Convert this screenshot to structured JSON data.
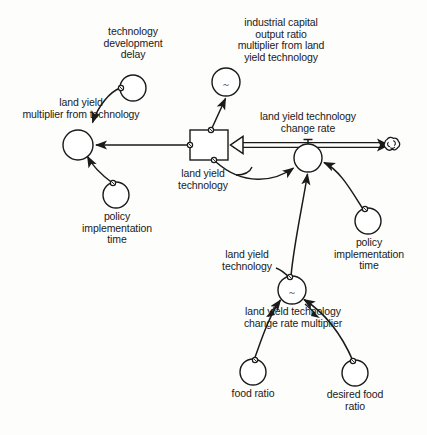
{
  "diagram": {
    "type": "system-dynamics-stock-flow",
    "title_visible": false,
    "background_color": "#fdfdfc",
    "stroke_color": "#1a1a1a",
    "labels": {
      "technology_development_delay": "technology\ndevelopment\ndelay",
      "industrial_capital_multiplier": "industrial capital\noutput ratio\nmultiplier from land\nyield technology",
      "land_yield_multiplier_from_technology": "land yield\nmultiplier from technology",
      "land_yield_technology_change_rate": "land yield technology\nchange rate",
      "land_yield_technology_stock": "land yield\ntechnology",
      "policy_implementation_time_left": "policy\nimplementation\ntime",
      "policy_implementation_time_right": "policy\nimplementation\ntime",
      "land_yield_technology_aux": "land yield\ntechnology",
      "land_yield_technology_change_rate_multiplier": "land yield technology\nchange rate multiplier",
      "food_ratio": "food ratio",
      "desired_food_ratio": "desired food\nratio"
    },
    "nodes": [
      {
        "id": "technology-development-delay",
        "kind": "auxiliary-circle",
        "label": "technology development delay",
        "cx": 133,
        "cy": 88,
        "r": 13,
        "marker": ""
      },
      {
        "id": "industrial-capital-output-ratio-multiplier",
        "kind": "auxiliary-circle",
        "label": "industrial capital output ratio multiplier from land yield technology",
        "cx": 226,
        "cy": 82,
        "r": 14,
        "marker": "~"
      },
      {
        "id": "land-yield-multiplier-from-technology",
        "kind": "auxiliary-circle",
        "label": "land yield multiplier from technology",
        "cx": 78,
        "cy": 145,
        "r": 15,
        "marker": ""
      },
      {
        "id": "land-yield-technology-stock",
        "kind": "stock-box",
        "label": "land yield technology",
        "x": 190,
        "y": 130,
        "w": 38,
        "h": 30
      },
      {
        "id": "land-yield-technology-change-rate-valve",
        "kind": "flow-valve-circle",
        "label": "land yield technology change rate",
        "cx": 308,
        "cy": 158,
        "r": 14,
        "marker": ""
      },
      {
        "id": "sink-cloud",
        "kind": "cloud",
        "label": "",
        "cx": 392,
        "cy": 146,
        "r": 10
      },
      {
        "id": "policy-implementation-time-left",
        "kind": "auxiliary-circle",
        "label": "policy implementation time",
        "cx": 116,
        "cy": 195,
        "r": 13,
        "marker": ""
      },
      {
        "id": "policy-implementation-time-right",
        "kind": "auxiliary-circle",
        "label": "policy implementation time",
        "cx": 368,
        "cy": 221,
        "r": 13,
        "marker": ""
      },
      {
        "id": "land-yield-technology-change-rate-multiplier",
        "kind": "auxiliary-circle",
        "label": "land yield technology change rate multiplier",
        "cx": 292,
        "cy": 290,
        "r": 14,
        "marker": "~"
      },
      {
        "id": "food-ratio",
        "kind": "auxiliary-circle",
        "label": "food ratio",
        "cx": 253,
        "cy": 372,
        "r": 13,
        "marker": ""
      },
      {
        "id": "desired-food-ratio",
        "kind": "auxiliary-circle",
        "label": "desired food ratio",
        "cx": 355,
        "cy": 373,
        "r": 13,
        "marker": ""
      }
    ],
    "connectors": [
      {
        "from": "technology-development-delay",
        "to": "land-yield-multiplier-from-technology",
        "style": "curved-arrow"
      },
      {
        "from": "land-yield-technology-stock",
        "to": "industrial-capital-output-ratio-multiplier",
        "style": "straight-arrow"
      },
      {
        "from": "land-yield-technology-stock",
        "to": "land-yield-multiplier-from-technology",
        "style": "straight-arrow"
      },
      {
        "from": "policy-implementation-time-left",
        "to": "land-yield-multiplier-from-technology",
        "style": "curved-arrow"
      },
      {
        "from": "land-yield-technology-stock",
        "to": "land-yield-technology-change-rate-valve",
        "style": "curved-arrow"
      },
      {
        "from": "policy-implementation-time-right",
        "to": "land-yield-technology-change-rate-valve",
        "style": "curved-arrow"
      },
      {
        "from": "land-yield-technology-change-rate-multiplier",
        "to": "land-yield-technology-change-rate-valve",
        "style": "curved-arrow"
      },
      {
        "from": "food-ratio",
        "to": "land-yield-technology-change-rate-multiplier",
        "style": "curved-arrow"
      },
      {
        "from": "desired-food-ratio",
        "to": "land-yield-technology-change-rate-multiplier",
        "style": "curved-arrow"
      }
    ],
    "flows": [
      {
        "id": "land-yield-technology-change-rate-flow",
        "label": "land yield technology change rate",
        "from": "sink-cloud",
        "to": "land-yield-technology-stock",
        "style": "double-line-pipe-with-arrowhead"
      }
    ]
  }
}
